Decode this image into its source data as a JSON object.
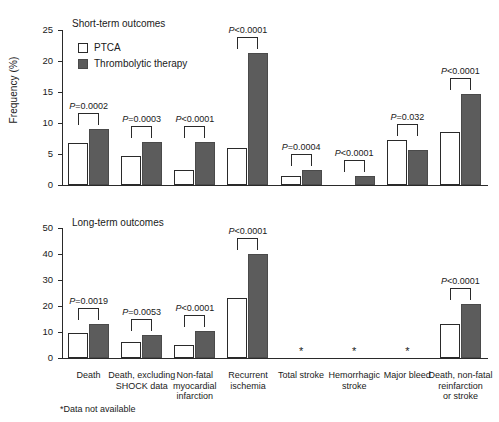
{
  "figure": {
    "ylabel": "Frequency (%)",
    "footnote": "*Data not available",
    "legend": [
      {
        "label": "PTCA",
        "key": "ptca",
        "color": "#ffffff"
      },
      {
        "label": "Thrombolytic therapy",
        "key": "throm",
        "color": "#5c5c5c"
      }
    ]
  },
  "chart_data": [
    {
      "type": "bar",
      "title": "Short-term outcomes",
      "xlabel": "",
      "ylabel": "Frequency (%)",
      "ylim": [
        0,
        25
      ],
      "yticks": [
        0,
        5,
        10,
        15,
        20,
        25
      ],
      "grid": false,
      "legend_position": "top-left",
      "categories": [
        "Death",
        "Death, excluding SHOCK data",
        "Non-fatal myocardial infarction",
        "Recurrent ischemia",
        "Total stroke",
        "Hemorrhagic stroke",
        "Major bleed",
        "Death, non-fatal reinfarction or stroke"
      ],
      "series": [
        {
          "name": "PTCA",
          "values": [
            6.8,
            4.7,
            2.4,
            6.0,
            1.5,
            0.05,
            7.3,
            8.5
          ]
        },
        {
          "name": "Thrombolytic therapy",
          "values": [
            9.1,
            6.9,
            6.9,
            21.3,
            2.4,
            1.4,
            5.7,
            14.7
          ]
        }
      ],
      "annotations": [
        "P=0.0002",
        "P=0.0003",
        "P<0.0001",
        "P<0.0001",
        "P=0.0004",
        "P<0.0001",
        "P=0.032",
        "P<0.0001"
      ]
    },
    {
      "type": "bar",
      "title": "Long-term outcomes",
      "xlabel": "",
      "ylabel": "Frequency (%)",
      "ylim": [
        0,
        50
      ],
      "yticks": [
        0,
        10,
        20,
        30,
        40,
        50
      ],
      "grid": false,
      "legend_position": "none",
      "categories": [
        "Death",
        "Death, excluding SHOCK data",
        "Non-fatal myocardial infarction",
        "Recurrent ischemia",
        "Total stroke",
        "Hemorrhagic stroke",
        "Major bleed",
        "Death, non-fatal reinfarction or stroke"
      ],
      "series": [
        {
          "name": "PTCA",
          "values": [
            9.6,
            6.3,
            5.0,
            23.2,
            null,
            null,
            null,
            13.0
          ]
        },
        {
          "name": "Thrombolytic therapy",
          "values": [
            13.0,
            8.8,
            10.4,
            40.0,
            null,
            null,
            null,
            20.7
          ]
        }
      ],
      "annotations": [
        "P=0.0019",
        "P=0.0053",
        "P<0.0001",
        "P<0.0001",
        null,
        null,
        null,
        "P<0.0001"
      ],
      "missing_marker": "*"
    }
  ],
  "xcategories": [
    {
      "lines": [
        "Death"
      ]
    },
    {
      "lines": [
        "Death, excluding",
        "SHOCK data"
      ]
    },
    {
      "lines": [
        "Non-fatal",
        "myocardial",
        "infarction"
      ]
    },
    {
      "lines": [
        "Recurrent",
        "ischemia"
      ]
    },
    {
      "lines": [
        "Total stroke"
      ]
    },
    {
      "lines": [
        "Hemorrhagic",
        "stroke"
      ]
    },
    {
      "lines": [
        "Major bleed"
      ]
    },
    {
      "lines": [
        "Death, non-fatal",
        "reinfarction",
        "or stroke"
      ]
    }
  ]
}
